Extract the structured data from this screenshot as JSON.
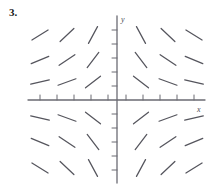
{
  "figure": {
    "label": "3.",
    "type": "slope-field"
  },
  "axes": {
    "x_label": "x",
    "y_label": "y",
    "x_axis_y": 100,
    "y_axis_x": 117,
    "x_min_px": 28,
    "x_max_px": 205,
    "y_min_px": 16,
    "y_max_px": 183,
    "axis_color": "#6b6b73",
    "tick_color": "#6b6b73",
    "tick_length": 5,
    "x_ticks": [
      40,
      57,
      74,
      91,
      108,
      126,
      143,
      160,
      177,
      194
    ],
    "y_ticks": [
      30,
      44,
      58,
      72,
      86,
      114,
      128,
      142,
      156,
      170
    ]
  },
  "chart_data": {
    "type": "slope-field",
    "title": "3.",
    "xlabel": "x",
    "ylabel": "y",
    "grid": false,
    "legend": "none",
    "equation": "dy/dx = -xy",
    "segment_color": "#55555d",
    "segment_length": 19,
    "columns_px": [
      40,
      67,
      93,
      141,
      168,
      194
    ],
    "rows_px": [
      35,
      60,
      82,
      118,
      142,
      168
    ],
    "columns_x": [
      -3,
      -2,
      -1,
      1,
      2,
      3
    ],
    "rows_y": [
      3,
      2,
      1,
      -1,
      -2,
      -3
    ],
    "slopes": [
      [
        0.62,
        0.95,
        1.85,
        -1.85,
        -0.95,
        -0.62
      ],
      [
        0.42,
        0.68,
        1.3,
        -1.3,
        -0.68,
        -0.42
      ],
      [
        0.22,
        0.36,
        0.78,
        -0.78,
        -0.36,
        -0.22
      ],
      [
        -0.22,
        -0.36,
        -0.78,
        0.78,
        0.36,
        0.22
      ],
      [
        -0.42,
        -0.68,
        -1.3,
        1.3,
        0.68,
        0.42
      ],
      [
        -0.62,
        -0.95,
        -1.85,
        1.85,
        0.95,
        0.62
      ]
    ]
  }
}
